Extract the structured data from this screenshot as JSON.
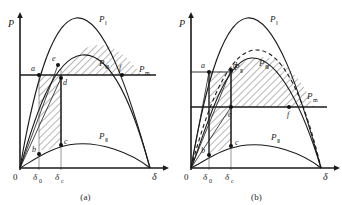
{
  "figure": {
    "panels": [
      {
        "id": "a",
        "caption": "(a)",
        "axes": {
          "y_label": "P",
          "x_label": "δ",
          "origin_label": "0"
        },
        "curve_labels": {
          "pre_fault": "P",
          "pre_fault_sub": "Ⅰ",
          "fault": "P",
          "fault_sub": "Ⅱ",
          "post_fault": "P",
          "post_fault_sub": "Ⅲ",
          "mech_power": "P",
          "mech_power_sub": "m"
        },
        "tick_labels": [
          {
            "text": "δ",
            "sub": "0"
          },
          {
            "text": "δ",
            "sub": "c"
          }
        ],
        "point_labels": [
          "a",
          "b",
          "c",
          "d",
          "e",
          "f"
        ],
        "shaded_regions": [
          "accelerating-area-abde",
          "decelerating-area-edf"
        ]
      },
      {
        "id": "b",
        "caption": "(b)",
        "axes": {
          "y_label": "P",
          "x_label": "δ",
          "origin_label": "0"
        },
        "curve_labels": {
          "pre_fault": "P",
          "pre_fault_sub": "Ⅰ",
          "fault": "P",
          "fault_sub": "Ⅱ",
          "post_fault_solid": "P",
          "post_fault_solid_sub": "Ⅱ",
          "post_fault_dashed": "P",
          "post_fault_dashed_sub": "Ⅲ",
          "mech_power": "P",
          "mech_power_sub": "m"
        },
        "tick_labels": [
          {
            "text": "δ",
            "sub": "0"
          },
          {
            "text": "δ",
            "sub": "c"
          }
        ],
        "point_labels": [
          "a",
          "b",
          "c",
          "d",
          "e",
          "f"
        ],
        "shaded_regions": [
          "accelerating-area-abcd",
          "decelerating-area-def"
        ]
      }
    ],
    "colors": {
      "curve": "#1a1a1a",
      "axis": "#1a1a1a",
      "hatch": "#2b2b2b",
      "text": "#222222",
      "background": "#ffffff"
    }
  }
}
